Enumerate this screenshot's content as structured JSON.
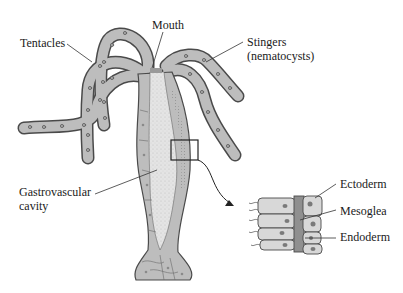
{
  "diagram": {
    "colors": {
      "tissue": "#bdbdbd",
      "tissue_outline": "#4a4a4a",
      "cavity": "#e2e2e2",
      "nucleus": "#8a8a8a",
      "mesoglea": "#8f8f8f",
      "line": "#333333",
      "background": "#ffffff"
    },
    "labels": {
      "mouth": "Mouth",
      "tentacles": "Tentacles",
      "stingers_line1": "Stingers",
      "stingers_line2": "(nematocysts)",
      "gastro_line1": "Gastrovascular",
      "gastro_line2": "cavity",
      "ectoderm": "Ectoderm",
      "mesoglea": "Mesoglea",
      "endoderm": "Endoderm"
    }
  }
}
